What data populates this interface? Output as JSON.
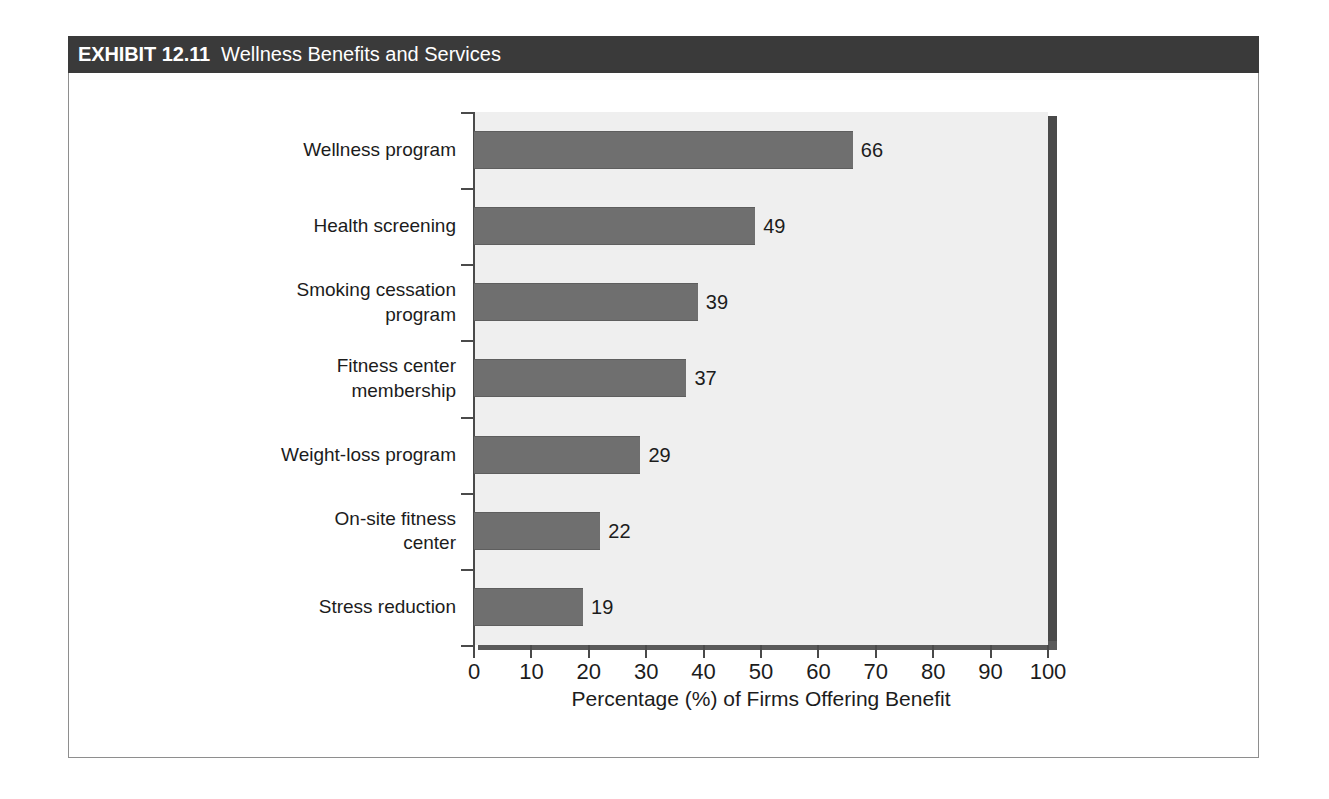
{
  "exhibit": {
    "number": "EXHIBIT 12.11",
    "title": "Wellness Benefits and Services"
  },
  "colors": {
    "title_bar_bg": "#3a3a3a",
    "title_text": "#ffffff",
    "plot_bg": "#efefef",
    "bar_fill": "#6f6f6f",
    "axis": "#4a4a4a",
    "shadow": "#4a4a4a",
    "frame_border": "#8e8e8e",
    "text": "#1c1c1c"
  },
  "chart_data": {
    "type": "bar",
    "orientation": "horizontal",
    "title": "Wellness Benefits and Services",
    "xlabel": "Percentage (%) of Firms Offering Benefit",
    "ylabel": "",
    "xlim": [
      0,
      100
    ],
    "xticks": [
      0,
      10,
      20,
      30,
      40,
      50,
      60,
      70,
      80,
      90,
      100
    ],
    "xticklabels": [
      "0",
      "10",
      "20",
      "30",
      "40",
      "50",
      "60",
      "70",
      "80",
      "90",
      "100"
    ],
    "grid": false,
    "legend": null,
    "categories": [
      "Wellness program",
      "Health screening",
      "Smoking cessation\nprogram",
      "Fitness center\nmembership",
      "Weight-loss program",
      "On-site fitness\ncenter",
      "Stress reduction"
    ],
    "values": [
      66,
      49,
      39,
      37,
      29,
      22,
      19
    ],
    "value_labels": [
      "66",
      "49",
      "39",
      "37",
      "29",
      "22",
      "19"
    ]
  }
}
